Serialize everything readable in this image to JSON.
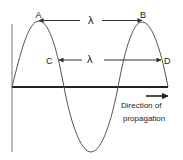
{
  "diagram": {
    "labels": {
      "A": "A",
      "B": "B",
      "C": "C",
      "D": "D",
      "lambda_top": "λ",
      "lambda_mid": "λ"
    },
    "direction_text": {
      "line1": "Direction of",
      "line2": "propagation"
    },
    "colors": {
      "wave": "#555555",
      "axis": "#222222",
      "vertical_axis": "#777777",
      "arrow": "#333333",
      "text": "#222222"
    }
  }
}
